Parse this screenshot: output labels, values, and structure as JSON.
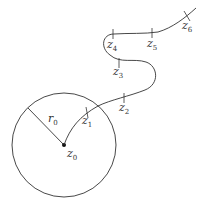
{
  "diagram": {
    "stroke_color": "#333333",
    "circle": {
      "cx": 64,
      "cy": 145,
      "r": 52
    },
    "center": {
      "label": "z",
      "sub": "0",
      "x": 64,
      "y": 145
    },
    "radius": {
      "label": "r",
      "sub": "0"
    },
    "points": [
      {
        "label": "z",
        "sub": "1"
      },
      {
        "label": "z",
        "sub": "2"
      },
      {
        "label": "z",
        "sub": "3"
      },
      {
        "label": "z",
        "sub": "4"
      },
      {
        "label": "z",
        "sub": "5"
      },
      {
        "label": "z",
        "sub": "6"
      }
    ]
  }
}
